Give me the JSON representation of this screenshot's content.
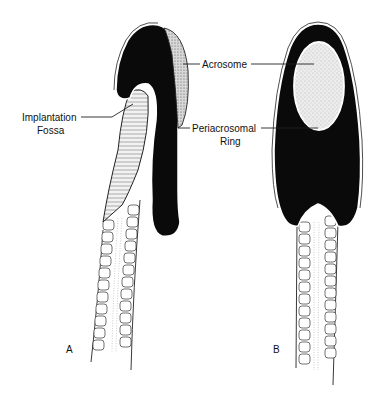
{
  "figure": {
    "labels": {
      "acrosome": "Acrosome",
      "implantation_fossa_line1": "Implantation",
      "implantation_fossa_line2": "Fossa",
      "periacrosomal_ring_line1": "Periacrosomal",
      "periacrosomal_ring_line2": "Ring"
    },
    "panels": {
      "a": "A",
      "b": "B"
    },
    "colors": {
      "nucleus": "#0a0a0a",
      "acrosome": "#e6e6e6",
      "background": "#ffffff",
      "line": "#222222"
    }
  }
}
